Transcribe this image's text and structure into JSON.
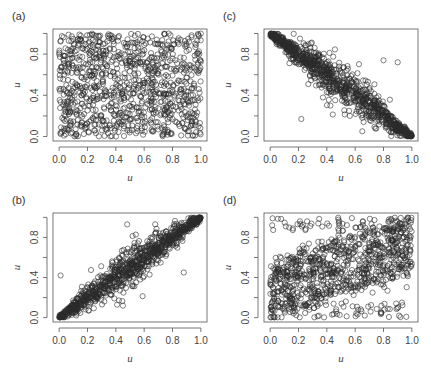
{
  "chart_data": [
    {
      "panel": "(a)",
      "type": "scatter",
      "title": "",
      "xlabel": "u",
      "ylabel": "u",
      "xlim": [
        0,
        1
      ],
      "ylim": [
        0,
        1
      ],
      "xticks": [
        "0.0",
        "0.2",
        "0.4",
        "0.6",
        "0.8",
        "1.0"
      ],
      "yticks": [
        "0.0",
        "0.4",
        "0.8"
      ],
      "grid": false,
      "dependence": "independence",
      "n_points": 1000,
      "marker": "open-circle",
      "description": "Uniform scatter over unit square, no dependence"
    },
    {
      "panel": "(c)",
      "type": "scatter",
      "title": "",
      "xlabel": "u",
      "ylabel": "u",
      "xlim": [
        0,
        1
      ],
      "ylim": [
        0,
        1
      ],
      "xticks": [
        "0.0",
        "0.2",
        "0.4",
        "0.6",
        "0.8",
        "1.0"
      ],
      "yticks": [
        "0.0",
        "0.4",
        "0.8"
      ],
      "grid": false,
      "dependence": "strong-negative",
      "n_points": 1000,
      "marker": "open-circle",
      "description": "Points concentrated along anti-diagonal from (0,1) to (1,0), tight at corners",
      "outliers": [
        [
          0.22,
          0.17
        ],
        [
          0.9,
          0.72
        ],
        [
          0.8,
          0.74
        ]
      ]
    },
    {
      "panel": "(b)",
      "type": "scatter",
      "title": "",
      "xlabel": "u",
      "ylabel": "u",
      "xlim": [
        0,
        1
      ],
      "ylim": [
        0,
        1
      ],
      "xticks": [
        "0.0",
        "0.2",
        "0.4",
        "0.6",
        "0.8",
        "1.0"
      ],
      "yticks": [
        "0.0",
        "0.4",
        "0.8"
      ],
      "grid": false,
      "dependence": "strong-positive",
      "n_points": 1000,
      "marker": "open-circle",
      "description": "Points concentrated along diagonal from (0,0) to (1,1), tight at corners",
      "outliers": [
        [
          0.01,
          0.42
        ],
        [
          0.48,
          0.93
        ],
        [
          0.88,
          0.45
        ],
        [
          0.45,
          0.12
        ]
      ]
    },
    {
      "panel": "(d)",
      "type": "scatter",
      "title": "",
      "xlabel": "u",
      "ylabel": "u",
      "xlim": [
        0,
        1
      ],
      "ylim": [
        0,
        1
      ],
      "xticks": [
        "0.0",
        "0.2",
        "0.4",
        "0.6",
        "0.8",
        "1.0"
      ],
      "yticks": [
        "0.0",
        "0.4",
        "0.8"
      ],
      "grid": false,
      "dependence": "weak-positive",
      "n_points": 1000,
      "marker": "open-circle",
      "description": "Widely spread with mild positive dependence, denser at (0,0) and (1,1) corners"
    }
  ],
  "panels": {
    "a": {
      "label": "(a)"
    },
    "b": {
      "label": "(b)"
    },
    "c": {
      "label": "(c)"
    },
    "d": {
      "label": "(d)"
    }
  },
  "colors": {
    "marker_stroke": "#2a2a2a",
    "axis": "#555555",
    "text": "#444444",
    "background": "#ffffff"
  }
}
